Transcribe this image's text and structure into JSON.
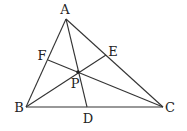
{
  "diagram": {
    "type": "triangle-cevians",
    "points": {
      "A": {
        "label": "A",
        "x": 66,
        "y": 19,
        "lx": 65,
        "ly": 14
      },
      "B": {
        "label": "B",
        "x": 26,
        "y": 107,
        "lx": 19,
        "ly": 112
      },
      "C": {
        "label": "C",
        "x": 163,
        "y": 107,
        "lx": 170,
        "ly": 112
      },
      "D": {
        "label": "D",
        "x": 87,
        "y": 107,
        "lx": 88,
        "ly": 122
      },
      "E": {
        "label": "E",
        "x": 106,
        "y": 55,
        "lx": 113,
        "ly": 56
      },
      "F": {
        "label": "F",
        "x": 48,
        "y": 60,
        "lx": 42,
        "ly": 60
      },
      "P": {
        "label": "P",
        "x": 78,
        "y": 72,
        "lx": 75,
        "ly": 88
      }
    },
    "segments": [
      [
        "A",
        "B"
      ],
      [
        "B",
        "C"
      ],
      [
        "C",
        "A"
      ],
      [
        "A",
        "D"
      ],
      [
        "B",
        "E"
      ],
      [
        "C",
        "F"
      ]
    ],
    "colors": {
      "line": "#333333",
      "text": "#222222",
      "background": "#ffffff"
    }
  }
}
